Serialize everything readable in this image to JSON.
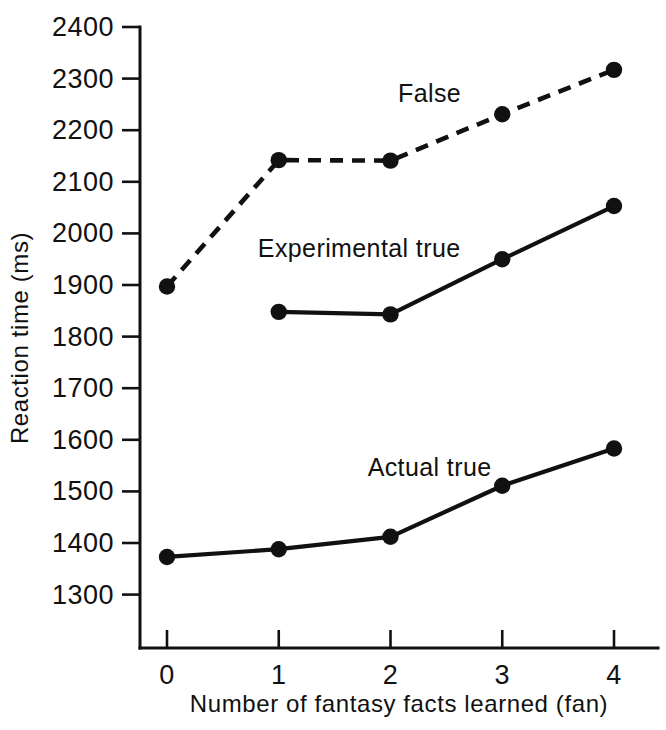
{
  "chart_data": {
    "type": "line",
    "title": "",
    "xlabel": "Number of fantasy facts learned (fan)",
    "ylabel": "Reaction time (ms)",
    "x": [
      0,
      1,
      2,
      3,
      4
    ],
    "xtick_labels": [
      "0",
      "1",
      "2",
      "3",
      "4"
    ],
    "xlim": [
      -0.25,
      4.25
    ],
    "ylim": [
      1240,
      2400
    ],
    "ytick_labels": [
      "1300",
      "1400",
      "1500",
      "1600",
      "1700",
      "1800",
      "1900",
      "2000",
      "2100",
      "2200",
      "2300",
      "2400"
    ],
    "yticks": [
      1300,
      1400,
      1500,
      1600,
      1700,
      1800,
      1900,
      2000,
      2100,
      2200,
      2300,
      2400
    ],
    "grid": false,
    "legend_position": "inline-annotations",
    "series": [
      {
        "name": "False",
        "label": "False",
        "style": "dashed",
        "marker": "filled-circle",
        "x": [
          0,
          1,
          2,
          3,
          4
        ],
        "values": [
          1897,
          2142,
          2141,
          2231,
          2317
        ]
      },
      {
        "name": "Experimental true",
        "label": "Experimental true",
        "style": "solid",
        "marker": "filled-circle",
        "x": [
          1,
          2,
          3,
          4
        ],
        "values": [
          1848,
          1843,
          1950,
          2053
        ]
      },
      {
        "name": "Actual true",
        "label": "Actual true",
        "style": "solid",
        "marker": "filled-circle",
        "x": [
          0,
          1,
          2,
          3,
          4
        ],
        "values": [
          1373,
          1388,
          1412,
          1511,
          1583
        ]
      }
    ],
    "annotations": [
      {
        "text": "False",
        "x": 2.35,
        "y": 2255
      },
      {
        "text": "Experimental true",
        "x": 1.72,
        "y": 1955
      },
      {
        "text": "Actual true",
        "x": 2.35,
        "y": 1530
      }
    ],
    "colors": {
      "ink": "#111111",
      "background": "#ffffff"
    }
  }
}
